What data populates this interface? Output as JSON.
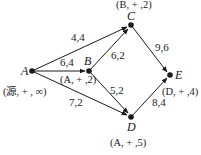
{
  "diagram": {
    "type": "flow-network-labeling",
    "nodes": [
      {
        "id": "A",
        "label": "A",
        "x": 32,
        "y": 71,
        "mark": "(源, + , ∞)"
      },
      {
        "id": "B",
        "label": "B",
        "x": 89,
        "y": 71,
        "mark": "(A, + ,2)"
      },
      {
        "id": "C",
        "label": "C",
        "x": 131,
        "y": 25,
        "mark": "(B, + ,2)"
      },
      {
        "id": "D",
        "label": "D",
        "x": 131,
        "y": 117,
        "mark": "(A, + ,5)"
      },
      {
        "id": "E",
        "label": "E",
        "x": 170,
        "y": 75,
        "mark": "(D, + ,4)"
      }
    ],
    "edges": [
      {
        "from": "A",
        "to": "C",
        "label": "4,4"
      },
      {
        "from": "A",
        "to": "B",
        "label": "6,4"
      },
      {
        "from": "A",
        "to": "D",
        "label": "7,2"
      },
      {
        "from": "B",
        "to": "C",
        "label": "6,2"
      },
      {
        "from": "B",
        "to": "D",
        "label": "5,2"
      },
      {
        "from": "C",
        "to": "E",
        "label": "9,6"
      },
      {
        "from": "D",
        "to": "E",
        "label": "8,4"
      }
    ]
  }
}
